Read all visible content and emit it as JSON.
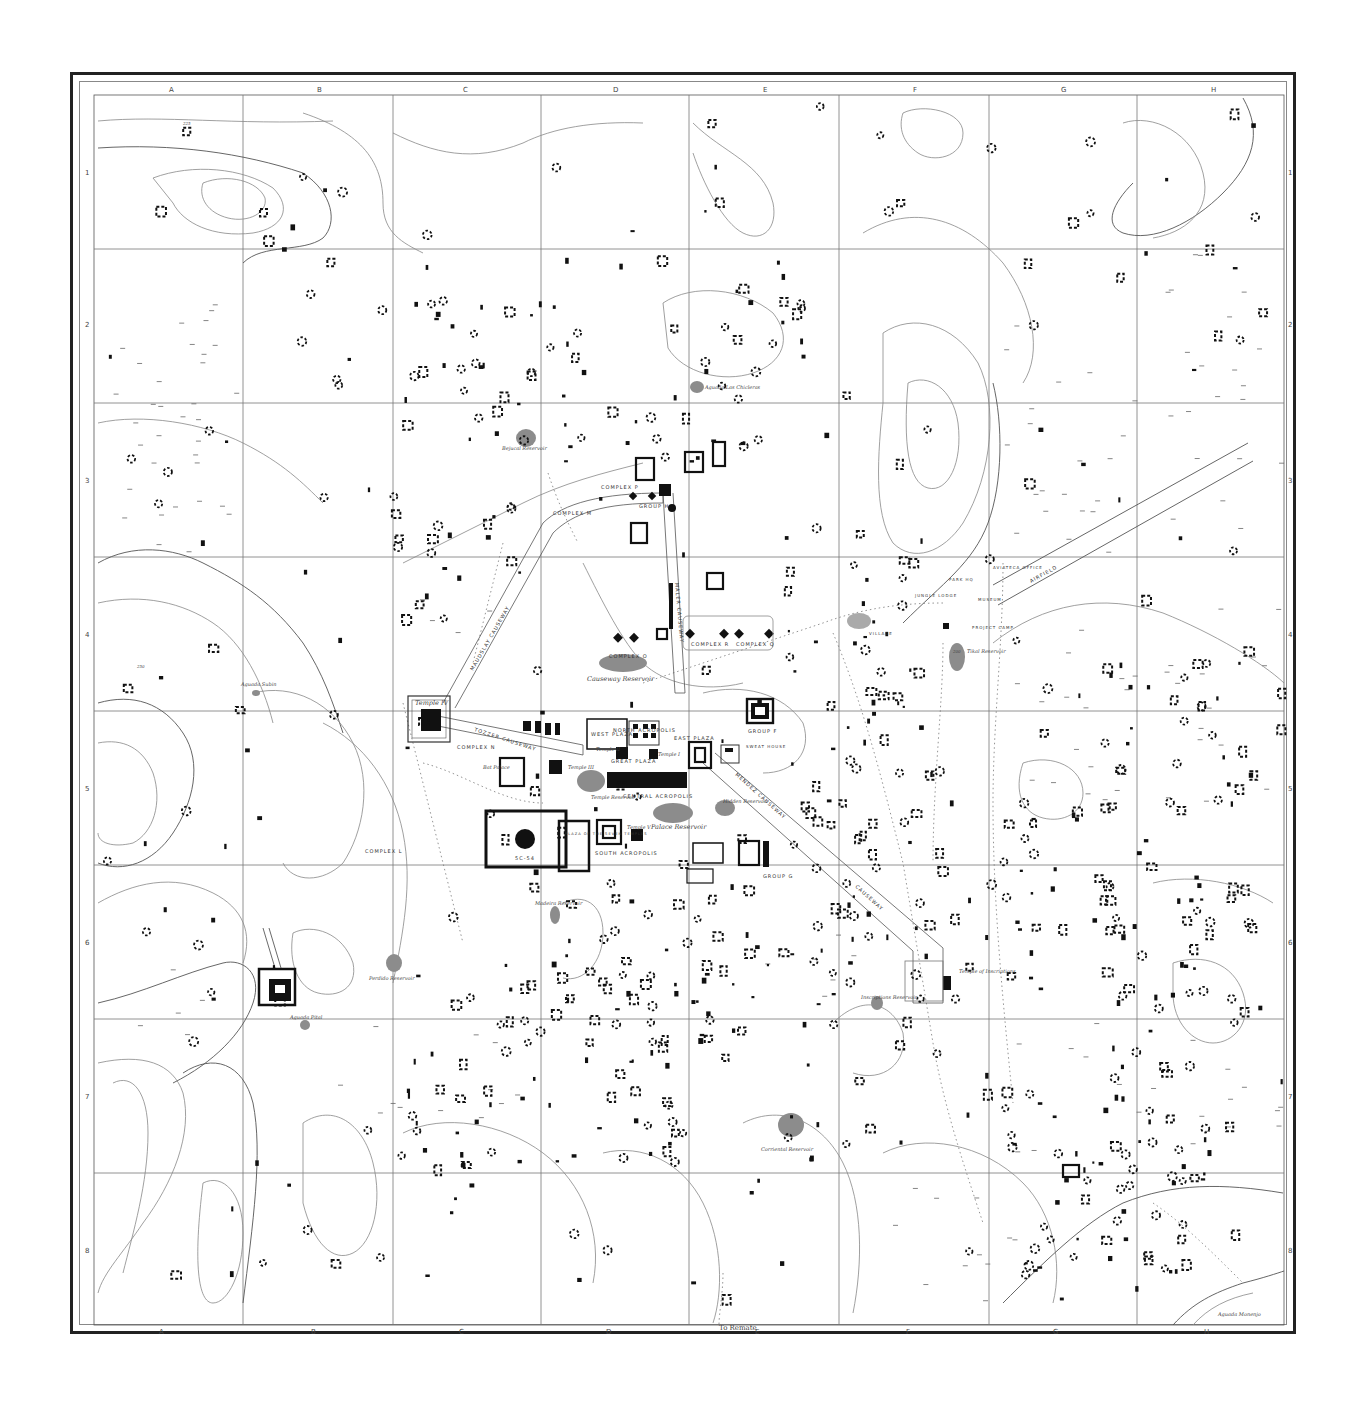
{
  "map": {
    "title": "Tikal site map",
    "columns": [
      "A",
      "B",
      "C",
      "D",
      "E",
      "F",
      "G",
      "H"
    ],
    "rows": [
      "1",
      "2",
      "3",
      "4",
      "5",
      "6",
      "7",
      "8"
    ],
    "contour_values": [
      "200",
      "225",
      "250"
    ],
    "bottom_note": "To Remate",
    "labels": {
      "temple_iv": "Temple IV",
      "tozzer_causeway": "TOZZER CAUSEWAY",
      "maudslay_causeway": "MAUDSLAY CAUSEWAY",
      "maler_causeway": "MALER CAUSEWAY",
      "mendez_causeway": "MENDEZ CAUSEWAY",
      "causeway": "CAUSEWAY",
      "north_acropolis": "NORTH ACROPOLIS",
      "west_plaza": "WEST PLAZA",
      "east_plaza": "EAST PLAZA",
      "great_plaza": "GREAT PLAZA",
      "central_acropolis": "CENTRAL ACROPOLIS",
      "south_acropolis": "SOUTH ACROPOLIS",
      "plaza_seven_temples": "PLAZA OF THE SEVEN TEMPLES",
      "mundo_perdido": "5C-54",
      "temple_ii": "Temple II",
      "temple_iii": "Temple III",
      "temple_i": "Temple I",
      "temple_v": "Temple V",
      "bat_palace": "Bat Palace",
      "complex_n": "COMPLEX N",
      "complex_m": "COMPLEX M",
      "complex_l": "COMPLEX L",
      "complex_o": "COMPLEX O",
      "complex_p": "COMPLEX P",
      "complex_q": "COMPLEX Q",
      "complex_r": "COMPLEX R",
      "group_h": "GROUP H",
      "group_f": "GROUP F",
      "group_g": "GROUP G",
      "sweat_house": "SWEAT HOUSE",
      "temple_inscriptions": "Temple of Inscriptions",
      "temple_reservoir": "Temple Reservoir",
      "palace_reservoir": "Palace Reservoir",
      "hidden_reservoir": "Hidden Reservoir",
      "causeway_reservoir": "Causeway Reservoir",
      "bejucal_reservoir": "Bejucal Reservoir",
      "aguada_chiclero": "Aguada Las Chicleras",
      "aguada_subin": "Aguada Subin",
      "aguada_pital": "Aguada Pital",
      "perdido_reservoir": "Perdido Reservoir",
      "madeira_reservoir": "Madeira Reservoir",
      "inscriptions_reservoir": "Inscriptions Reservoir",
      "corriental_reservoir": "Corriental Reservoir",
      "tikal_reservoir": "Tikal Reservoir",
      "aguada_moreno": "Aguada Monenjo",
      "airfield": "AIRFIELD",
      "aviateca_office": "AVIATECA OFFICE",
      "park_hq": "PARK HQ",
      "museum": "MUSEUM",
      "jungle_lodge": "JUNGLE LODGE",
      "project_camp": "PROJECT CAMP",
      "village": "VILLAGE"
    }
  }
}
